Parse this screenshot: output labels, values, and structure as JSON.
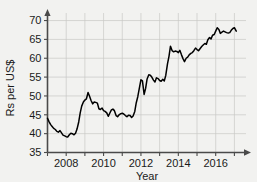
{
  "chart_data": {
    "type": "line",
    "title": "",
    "xlabel": "Year",
    "ylabel": "Rs per US$",
    "xlim": [
      2007.0,
      2017.3
    ],
    "ylim": [
      35,
      72
    ],
    "grid": true,
    "legend": "none",
    "x_ticks": [
      "2008",
      "2010",
      "2012",
      "2014",
      "2016"
    ],
    "x_tick_values": [
      2008,
      2010,
      2012,
      2014,
      2016
    ],
    "y_ticks": [
      "35",
      "40",
      "45",
      "50",
      "55",
      "60",
      "65",
      "70"
    ],
    "y_tick_values": [
      35,
      40,
      45,
      50,
      55,
      60,
      65,
      70
    ],
    "series": [
      {
        "name": "Rs per US$",
        "color": "#000000",
        "x": [
          2007.0,
          2007.08,
          2007.17,
          2007.25,
          2007.33,
          2007.42,
          2007.5,
          2007.58,
          2007.67,
          2007.75,
          2007.83,
          2007.92,
          2008.0,
          2008.08,
          2008.17,
          2008.25,
          2008.33,
          2008.42,
          2008.5,
          2008.58,
          2008.67,
          2008.75,
          2008.83,
          2008.92,
          2009.0,
          2009.08,
          2009.17,
          2009.25,
          2009.33,
          2009.42,
          2009.5,
          2009.58,
          2009.67,
          2009.75,
          2009.83,
          2009.92,
          2010.0,
          2010.08,
          2010.17,
          2010.25,
          2010.33,
          2010.42,
          2010.5,
          2010.58,
          2010.67,
          2010.75,
          2010.83,
          2010.92,
          2011.0,
          2011.08,
          2011.17,
          2011.25,
          2011.33,
          2011.42,
          2011.5,
          2011.58,
          2011.67,
          2011.75,
          2011.83,
          2011.92,
          2012.0,
          2012.08,
          2012.17,
          2012.25,
          2012.33,
          2012.42,
          2012.5,
          2012.58,
          2012.67,
          2012.75,
          2012.83,
          2012.92,
          2013.0,
          2013.08,
          2013.17,
          2013.25,
          2013.33,
          2013.42,
          2013.5,
          2013.58,
          2013.67,
          2013.75,
          2013.83,
          2013.92,
          2014.0,
          2014.08,
          2014.17,
          2014.25,
          2014.33,
          2014.42,
          2014.5,
          2014.58,
          2014.67,
          2014.75,
          2014.83,
          2014.92,
          2015.0,
          2015.08,
          2015.17,
          2015.25,
          2015.33,
          2015.42,
          2015.5,
          2015.58,
          2015.67,
          2015.75,
          2015.83,
          2015.92,
          2016.0,
          2016.08,
          2016.17,
          2016.25,
          2016.33,
          2016.42,
          2016.5,
          2016.58,
          2016.67,
          2016.75,
          2016.83,
          2016.92,
          2017.0,
          2017.1
        ],
        "y": [
          44.1,
          43.2,
          42.4,
          41.9,
          41.4,
          41.1,
          40.6,
          40.4,
          40.8,
          40.2,
          39.6,
          39.4,
          39.2,
          39.1,
          39.7,
          40.1,
          40.0,
          39.7,
          40.1,
          41.2,
          43.1,
          45.5,
          47.3,
          48.4,
          48.9,
          49.2,
          50.9,
          49.9,
          48.8,
          47.9,
          48.4,
          48.3,
          48.1,
          46.6,
          46.4,
          46.8,
          46.1,
          45.9,
          45.5,
          44.6,
          45.4,
          46.3,
          46.5,
          46.1,
          44.8,
          44.5,
          45.0,
          45.3,
          45.4,
          45.2,
          44.8,
          44.5,
          44.9,
          44.8,
          44.3,
          44.7,
          45.9,
          48.2,
          49.8,
          52.2,
          54.3,
          54.0,
          50.4,
          52.0,
          54.5,
          55.6,
          55.5,
          55.0,
          54.2,
          53.7,
          54.8,
          54.6,
          54.1,
          53.9,
          54.4,
          54.0,
          55.5,
          58.5,
          60.5,
          63.2,
          62.0,
          61.7,
          61.9,
          61.8,
          61.5,
          62.1,
          60.9,
          59.9,
          59.1,
          60.0,
          60.3,
          60.9,
          61.3,
          61.5,
          62.0,
          62.7,
          62.3,
          62.0,
          62.6,
          63.1,
          63.5,
          63.9,
          63.7,
          64.9,
          65.5,
          65.1,
          66.1,
          66.3,
          67.2,
          68.1,
          67.6,
          66.6,
          66.9,
          67.2,
          67.0,
          66.8,
          66.7,
          66.8,
          67.4,
          67.9,
          68.1,
          67.2
        ]
      }
    ]
  },
  "axis": {
    "y_label": "Rs per US$",
    "x_label": "Year"
  }
}
